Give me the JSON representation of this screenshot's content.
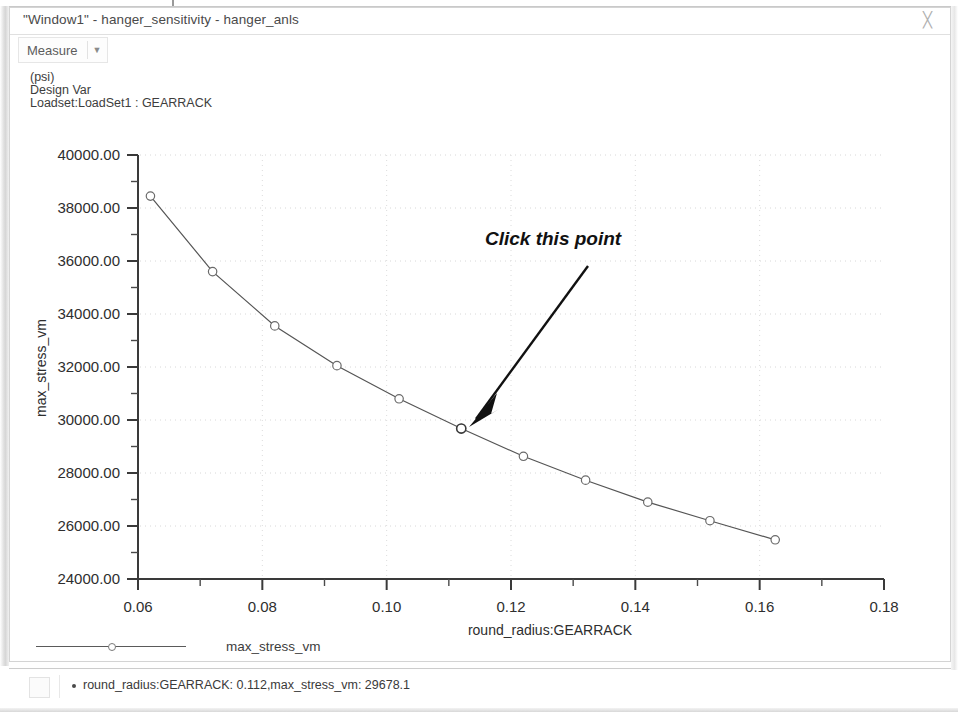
{
  "window": {
    "title": "\"Window1\" - hanger_sensitivity - hanger_anls",
    "close_label": "╳"
  },
  "toolbar": {
    "measure_label": "Measure",
    "caret_label": "▼"
  },
  "header": {
    "unit": "(psi)",
    "line2": "Design Var",
    "line3": "Loadset:LoadSet1 :  GEARRACK"
  },
  "annotation": {
    "text": "Click this point"
  },
  "legend": {
    "label": "max_stress_vm"
  },
  "status": {
    "text": "round_radius:GEARRACK: 0.112,max_stress_vm: 29678.1"
  },
  "chart_data": {
    "type": "line",
    "title": "",
    "xlabel": "round_radius:GEARRACK",
    "ylabel": "max_stress_vm",
    "unit": "(psi)",
    "xlim": [
      0.06,
      0.18
    ],
    "ylim": [
      24000,
      40000
    ],
    "xticks": [
      "0.06",
      "0.08",
      "0.10",
      "0.12",
      "0.14",
      "0.16",
      "0.18"
    ],
    "xtick_values": [
      0.06,
      0.08,
      0.1,
      0.12,
      0.14,
      0.16,
      0.18
    ],
    "xminor_step": 0.01,
    "yticks": [
      "24000.00",
      "26000.00",
      "28000.00",
      "30000.00",
      "32000.00",
      "34000.00",
      "36000.00",
      "38000.00",
      "40000.00"
    ],
    "ytick_values": [
      24000,
      26000,
      28000,
      30000,
      32000,
      34000,
      36000,
      38000,
      40000
    ],
    "yminor_step": 1000,
    "grid": true,
    "legend_position": "below-axis-left",
    "series": [
      {
        "name": "max_stress_vm",
        "marker": "circle",
        "color": "#555555",
        "x": [
          0.062,
          0.072,
          0.082,
          0.092,
          0.102,
          0.112,
          0.122,
          0.132,
          0.142,
          0.152,
          0.1625
        ],
        "values": [
          38450,
          35600,
          33550,
          32050,
          30800,
          29678.1,
          28630,
          27730,
          26900,
          26200,
          25480
        ]
      }
    ],
    "highlighted_point": {
      "x": 0.112,
      "y": 29678.1,
      "label": "round_radius:GEARRACK: 0.112,max_stress_vm: 29678.1"
    }
  }
}
